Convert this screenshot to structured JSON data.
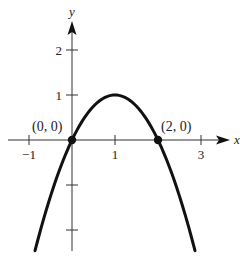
{
  "chart_data": {
    "type": "line",
    "title": "",
    "xlabel": "x",
    "ylabel": "y",
    "function": "y = 2x - x^2",
    "xlim": [
      -1.5,
      3.6
    ],
    "ylim": [
      -2.5,
      2.6
    ],
    "grid": false,
    "legend": null,
    "x_ticks": [
      -1,
      1,
      3
    ],
    "x_tick_labels": [
      "−1",
      "1",
      "3"
    ],
    "y_ticks": [
      1,
      2,
      -1,
      -2
    ],
    "y_tick_labels": [
      "1",
      "2",
      "",
      ""
    ],
    "series": [
      {
        "name": "parabola",
        "x": [
          -0.86,
          -0.5,
          0,
          0.5,
          1,
          1.5,
          2,
          2.5,
          2.86
        ],
        "y": [
          -2.46,
          -1.25,
          0,
          0.75,
          1,
          0.75,
          0,
          -1.25,
          -2.46
        ]
      }
    ],
    "points": [
      {
        "x": 0,
        "y": 0,
        "label": "(0, 0)"
      },
      {
        "x": 2,
        "y": 0,
        "label": "(2, 0)"
      }
    ],
    "vertex": {
      "x": 1,
      "y": 1
    }
  },
  "axes": {
    "x_label": "x",
    "y_label": "y"
  },
  "annotations": {
    "origin_point": "(0, 0)",
    "right_point": "(2, 0)"
  },
  "style": {
    "curve_color": "#111111",
    "axis_color": "#333333"
  }
}
